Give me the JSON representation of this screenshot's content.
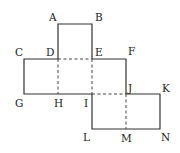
{
  "diagram": {
    "type": "cube-net",
    "colors": {
      "line": "#333333",
      "background": "#ffffff"
    },
    "points": {
      "A": [
        58,
        24
      ],
      "B": [
        92,
        24
      ],
      "C": [
        24,
        59
      ],
      "D": [
        58,
        59
      ],
      "E": [
        92,
        59
      ],
      "F": [
        126,
        59
      ],
      "G": [
        24,
        94
      ],
      "H": [
        58,
        94
      ],
      "I": [
        92,
        94
      ],
      "J": [
        126,
        94
      ],
      "K": [
        160,
        94
      ],
      "L": [
        92,
        129
      ],
      "M": [
        126,
        129
      ],
      "N": [
        160,
        129
      ]
    },
    "labels": {
      "A": "A",
      "B": "B",
      "C": "C",
      "D": "D",
      "E": "E",
      "F": "F",
      "G": "G",
      "H": "H",
      "I": "I",
      "J": "J",
      "K": "K",
      "L": "L",
      "M": "M",
      "N": "N"
    },
    "solid_edges": [
      "A-B",
      "A-D",
      "B-E",
      "C-D",
      "E-F",
      "C-G",
      "F-J",
      "G-I",
      "J-K",
      "K-N",
      "I-L",
      "L-N"
    ],
    "dashed_edges": [
      "D-E",
      "D-H",
      "E-I",
      "I-J",
      "J-M"
    ]
  }
}
